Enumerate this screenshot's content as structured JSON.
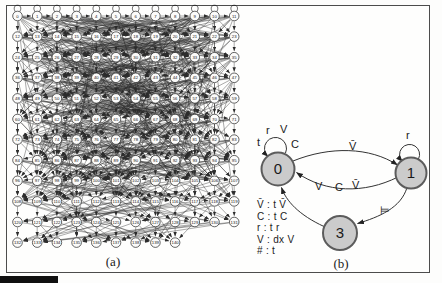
{
  "panel_a": {
    "caption": "(a)",
    "columns": 12,
    "node_labels": [
      0,
      1,
      2,
      3,
      4,
      5,
      6,
      7,
      8,
      9,
      10,
      11,
      12,
      13,
      14,
      15,
      16,
      17,
      18,
      19,
      20,
      21,
      22,
      23,
      24,
      25,
      26,
      27,
      28,
      29,
      30,
      31,
      32,
      33,
      34,
      35,
      36,
      37,
      38,
      39,
      40,
      41,
      42,
      43,
      44,
      45,
      46,
      47,
      48,
      49,
      50,
      51,
      52,
      53,
      54,
      55,
      56,
      57,
      58,
      59,
      60,
      61,
      62,
      63,
      64,
      65,
      66,
      67,
      68,
      69,
      70,
      71,
      72,
      73,
      74,
      75,
      76,
      77,
      78,
      79,
      80,
      81,
      82,
      83,
      84,
      85,
      86,
      87,
      88,
      89,
      90,
      91,
      92,
      93,
      94,
      95,
      96,
      97,
      98,
      99,
      100,
      101,
      102,
      103,
      104,
      105,
      106,
      107,
      108,
      109,
      110,
      111,
      112,
      113,
      114,
      115,
      116,
      117,
      118,
      119,
      120,
      121,
      122,
      123,
      124,
      125,
      126,
      127,
      128,
      129,
      130,
      131,
      132,
      133,
      134,
      135,
      136,
      137,
      138,
      139,
      140
    ]
  },
  "panel_b": {
    "caption": "(b)",
    "state_fill": "#cbcbcb",
    "states": [
      {
        "label": "0"
      },
      {
        "label": "1"
      },
      {
        "label": "3"
      }
    ],
    "loop0_labels": [
      "t",
      "r",
      "V",
      "C"
    ],
    "loop1_label": "r",
    "edge_0_to_1_label": "V̄",
    "edge_1_to_0_labels": [
      "V",
      "C",
      "V̄"
    ],
    "edge_1_to_3_label": "⊨",
    "rules": [
      "V̄ : t V̄",
      "C : t C",
      "r : t r",
      "V : dx V",
      "# : t"
    ]
  }
}
